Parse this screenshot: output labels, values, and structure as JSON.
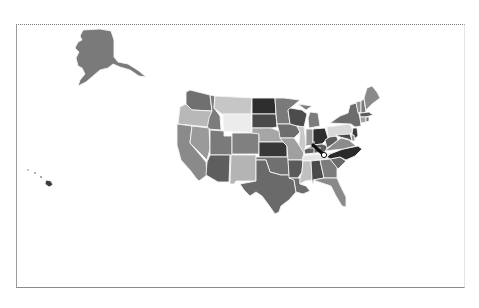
{
  "map": {
    "type": "choropleth",
    "region": "United States",
    "palette": "grayscale",
    "colors": {
      "background": "#ffffff",
      "state_border": "#f4f4f4",
      "frame_border": "#8c8c8c"
    },
    "states": {
      "AK": "#7a7a7a",
      "HI": "#3c3c3c",
      "WA": "#707070",
      "OR": "#b8b8b8",
      "CA": "#8a8a8a",
      "ID": "#7c7c7c",
      "NV": "#9a9a9a",
      "MT": "#c6c6c6",
      "WY": "#ececec",
      "UT": "#7a7a7a",
      "AZ": "#5e5e5e",
      "CO": "#808080",
      "NM": "#b4b4b4",
      "ND": "#2e2e2e",
      "SD": "#4a4a4a",
      "NE": "#a6a6a6",
      "KS": "#383838",
      "OK": "#707070",
      "TX": "#6a6a6a",
      "MN": "#7a7a7a",
      "IA": "#6e6e6e",
      "MO": "#a0a0a0",
      "AR": "#5a5a5a",
      "LA": "#6c6c6c",
      "WI": "#4c4c4c",
      "IL": "#c8c8c8",
      "MI": "#7c7c7c",
      "IN": "#9a9a9a",
      "OH": "#2e2e2e",
      "KY": "#606060",
      "TN": "#e4e4e4",
      "MS": "#c0c0c0",
      "AL": "#4a4a4a",
      "GA": "#7c7c7c",
      "FL": "#8a8a8a",
      "SC": "#6a6a6a",
      "NC": "#2a2a2a",
      "VA": "#8c8c8c",
      "WV": "#5c5c5c",
      "PA": "#d8d8d8",
      "NY": "#6c6c6c",
      "VT": "#909090",
      "NH": "#7a7a7a",
      "ME": "#8a8a8a",
      "MA": "#5c5c5c",
      "CT": "#a0a0a0",
      "RI": "#707070",
      "NJ": "#3a3a3a",
      "DE": "#909090",
      "MD": "#4a4a4a"
    }
  },
  "cursor": {
    "icon": "drag-crosshair-icon",
    "x": 323,
    "y": 153
  }
}
